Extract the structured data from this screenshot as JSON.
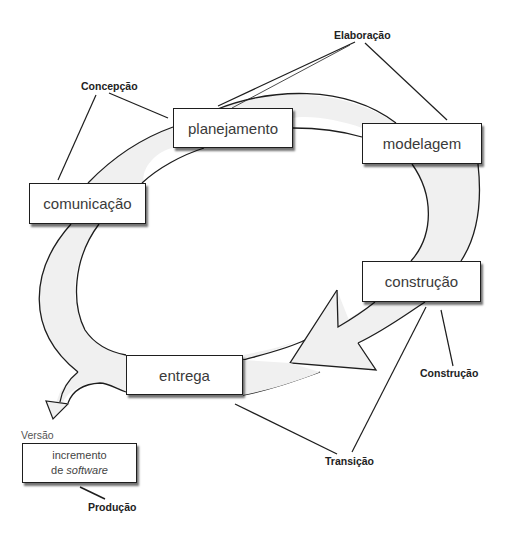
{
  "diagram": {
    "type": "process-cycle",
    "activities": [
      {
        "id": "comunicacao",
        "label": "comunicação"
      },
      {
        "id": "planejamento",
        "label": "planejamento"
      },
      {
        "id": "modelagem",
        "label": "modelagem"
      },
      {
        "id": "construcao",
        "label": "construção"
      },
      {
        "id": "entrega",
        "label": "entrega"
      }
    ],
    "phases": {
      "concepcao": "Concepção",
      "elaboracao": "Elaboração",
      "construcao": "Construção",
      "transicao": "Transição",
      "producao": "Produção"
    },
    "release_label": "Versão",
    "output_box": {
      "line1": "incremento",
      "line2_prefix": "de ",
      "line2_italic": "software"
    },
    "colors": {
      "band_fill": "#f0f0f0",
      "stroke": "#1e1e1e",
      "box_fill": "#ffffff"
    }
  }
}
